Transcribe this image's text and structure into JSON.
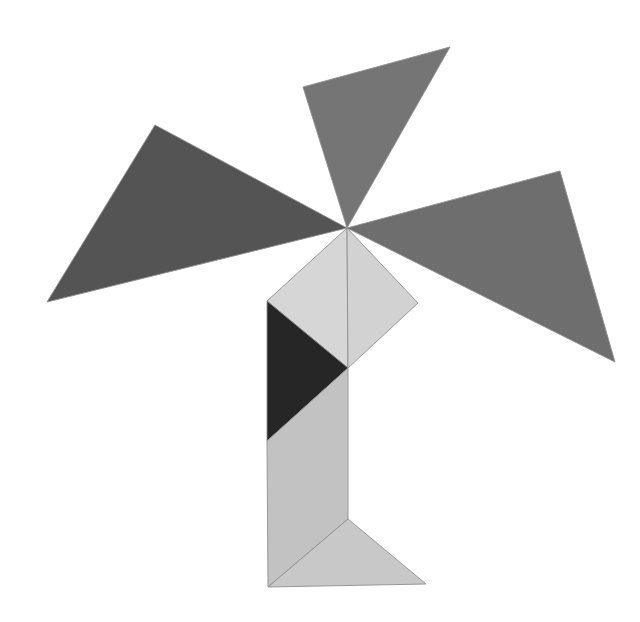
{
  "figure": {
    "canvas_width": 640,
    "canvas_height": 622,
    "background_color": "#ffffff",
    "hub_point": [
      347,
      228
    ],
    "pieces": [
      {
        "id": "top-triangle",
        "name": "large-triangle-top",
        "fill": "#757575",
        "stroke": "#6a6a6a",
        "points": "303,87 450,47 347,228"
      },
      {
        "id": "left-triangle",
        "name": "large-triangle-left",
        "fill": "#545454",
        "stroke": "#4d4d4d",
        "points": "155,125 47,302 347,228"
      },
      {
        "id": "right-triangle",
        "name": "large-triangle-right",
        "fill": "#6e6e6e",
        "stroke": "#666666",
        "points": "347,228 560,171 615,362"
      },
      {
        "id": "center-diamond-left",
        "name": "square-piece-left-half",
        "fill": "#d6d6d6",
        "stroke": "#9a9a9a",
        "points": "347,228 267,301 348,368"
      },
      {
        "id": "center-diamond-right",
        "name": "square-piece-right-half",
        "fill": "#d2d2d2",
        "stroke": "#9a9a9a",
        "points": "347,228 418,303 348,368"
      },
      {
        "id": "body-dark-triangle",
        "name": "small-triangle-dark-body",
        "fill": "#262626",
        "stroke": "#232323",
        "points": "267,301 267,441 348,368"
      },
      {
        "id": "body-lower-strip",
        "name": "parallelogram-lower-body",
        "fill": "#c2c2c2",
        "stroke": "#9a9a9a",
        "points": "267,441 348,368 348,519 268,587"
      },
      {
        "id": "foot-triangle",
        "name": "small-triangle-foot",
        "fill": "#c8c8c8",
        "stroke": "#9a9a9a",
        "points": "348,519 426,584 268,587"
      }
    ],
    "palette": {
      "darkest": "#262626",
      "dark": "#545454",
      "medium_dark": "#6e6e6e",
      "medium": "#757575",
      "light": "#c2c2c2",
      "lightest": "#d6d6d6",
      "outline": "#9a9a9a"
    }
  }
}
